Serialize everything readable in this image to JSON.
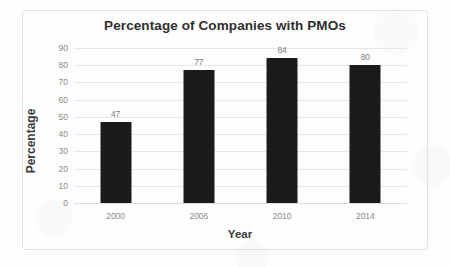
{
  "chart_data": {
    "type": "bar",
    "title": "Percentage of Companies with PMOs",
    "xlabel": "Year",
    "ylabel": "Percentage",
    "categories": [
      "2000",
      "2006",
      "2010",
      "2014"
    ],
    "values": [
      47,
      77,
      84,
      80
    ],
    "value_labels": [
      "47",
      "77",
      "84",
      "80"
    ],
    "ylim": [
      0,
      90
    ],
    "ytick_step": 10,
    "yticks": [
      90,
      80,
      70,
      60,
      50,
      40,
      30,
      20,
      10,
      0
    ],
    "ytick_labels": [
      "90",
      "80",
      "70",
      "60",
      "50",
      "40",
      "30",
      "20",
      "10",
      "0"
    ],
    "grid": true,
    "legend": false,
    "series": [
      {
        "name": "Percentage of Companies with PMOs",
        "values": [
          47,
          77,
          84,
          80
        ]
      }
    ],
    "colors": {
      "bar": "#1b1b1b",
      "gridline": "#e6e6e6",
      "title_text": "#2e2e2e",
      "axis_title_text": "#3a3a3a",
      "tick_text": "#8a8a8a",
      "value_label_text": "#7d7d7d",
      "background": "#fdfdfd",
      "frame_border": "#e2e2e2"
    }
  }
}
